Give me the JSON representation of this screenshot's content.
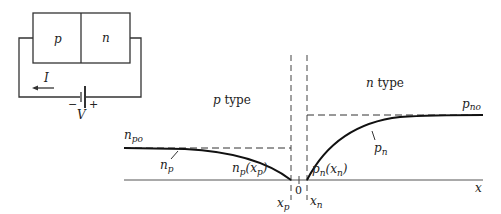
{
  "circuit": {
    "p_label": "p",
    "n_label": "n",
    "current_label": "I",
    "voltage_label": "V",
    "minus": "−",
    "plus": "+"
  },
  "plot": {
    "p_region_label_var": "p",
    "p_region_label_text": " type",
    "n_region_label_var": "n",
    "n_region_label_text": " type",
    "npo_main": "n",
    "npo_sub": "po",
    "pno_main": "p",
    "pno_sub": "no",
    "np_main": "n",
    "np_sub": "p",
    "pn_main": "p",
    "pn_sub": "n",
    "np_xp_main": "n",
    "np_xp_sub": "p",
    "np_xp_arg_open": "(x",
    "np_xp_arg_sub": "p",
    "np_xp_arg_close": ")",
    "pn_xn_main": "p",
    "pn_xn_sub": "n",
    "pn_xn_arg_open": "(x",
    "pn_xn_arg_sub": "n",
    "pn_xn_arg_close": ")",
    "xp_main": "x",
    "xp_sub": "p",
    "xn_main": "x",
    "xn_sub": "n",
    "origin": "0",
    "x_axis": "x"
  },
  "colors": {
    "ink": "#222222",
    "background": "#ffffff"
  }
}
